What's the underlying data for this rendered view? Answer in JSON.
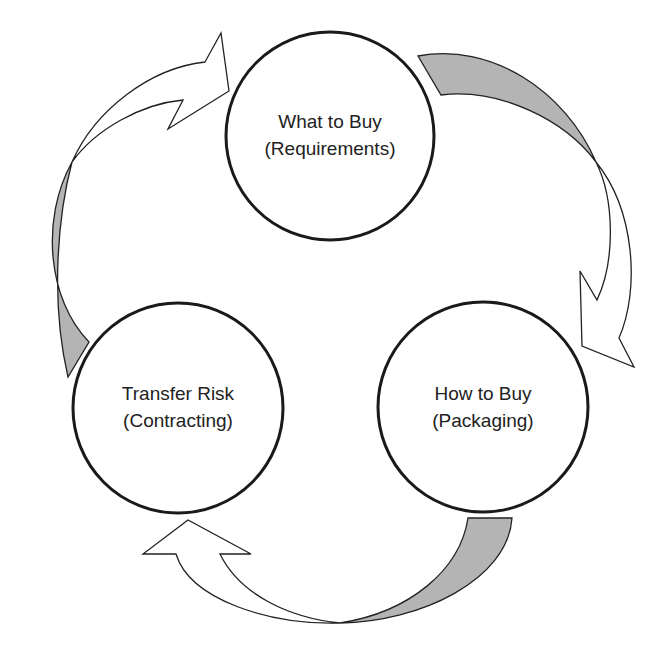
{
  "diagram": {
    "type": "cycle",
    "nodes": [
      {
        "id": "top",
        "line1": "What to Buy",
        "line2": "(Requirements)"
      },
      {
        "id": "right",
        "line1": "How to Buy",
        "line2": "(Packaging)"
      },
      {
        "id": "left",
        "line1": "Transfer Risk",
        "line2": "(Contracting)"
      }
    ],
    "edges": [
      {
        "from": "What to Buy (Requirements)",
        "to": "How to Buy (Packaging)"
      },
      {
        "from": "How to Buy (Packaging)",
        "to": "Transfer Risk (Contracting)"
      },
      {
        "from": "Transfer Risk (Contracting)",
        "to": "What to Buy (Requirements)"
      }
    ],
    "colors": {
      "arrow_back_face": "#b4b4b4",
      "arrow_front_face": "#ffffff",
      "outline": "#1a1a1a"
    }
  }
}
